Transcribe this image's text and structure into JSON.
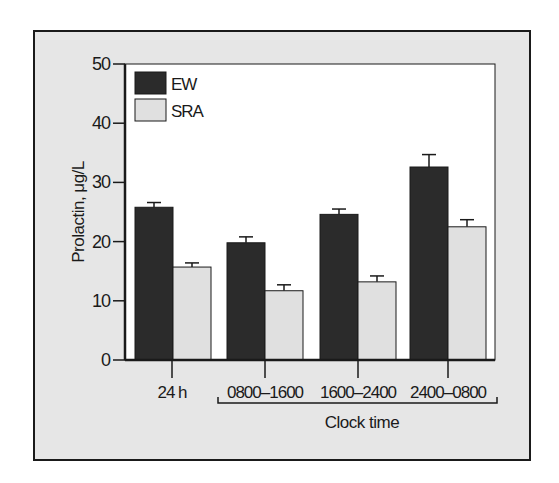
{
  "chart_data": {
    "type": "bar",
    "title": "",
    "xlabel": "Clock time",
    "ylabel": "Prolactin, μg/L",
    "ylim": [
      0,
      50
    ],
    "yticks": [
      0,
      10,
      20,
      30,
      40,
      50
    ],
    "grid": false,
    "legend_position": "upper-left inside plot",
    "categories": [
      "24 h",
      "0800–1600",
      "1600–2400",
      "2400–0800"
    ],
    "bracket_label": "Clock time",
    "bracket_categories": [
      "0800–1600",
      "1600–2400",
      "2400–0800"
    ],
    "series": [
      {
        "name": "EW",
        "color": "#2b2b2b",
        "values": [
          25.8,
          19.8,
          24.6,
          32.6
        ],
        "errors": [
          0.8,
          1.0,
          0.9,
          2.1
        ]
      },
      {
        "name": "SRA",
        "color": "#e0e0e0",
        "values": [
          15.7,
          11.7,
          13.2,
          22.5
        ],
        "errors": [
          0.7,
          1.0,
          1.0,
          1.2
        ]
      }
    ]
  },
  "labels": {
    "y_axis_title": "Prolactin, μg/L",
    "x_axis_title": "Clock time",
    "legend": [
      "EW",
      "SRA"
    ]
  },
  "colors": {
    "frame_bg": "#e6e6e6",
    "plot_bg": "#ffffff",
    "ew": "#2b2b2b",
    "sra": "#e0e0e0",
    "axis": "#1a1a1a"
  }
}
